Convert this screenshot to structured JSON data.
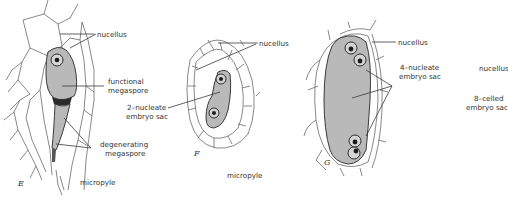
{
  "figure": {
    "panels": [
      {
        "id": "E",
        "letter": "E",
        "labels": {
          "nucellus": "nucellus",
          "functional_megaspore_1": "functional",
          "functional_megaspore_2": "megaspore",
          "degenerating_megaspore_1": "degenerating",
          "degenerating_megaspore_2": "megaspore",
          "micropyle": "micropyle"
        }
      },
      {
        "id": "F",
        "letter": "F",
        "labels": {
          "nucellus": "nucellus",
          "embryo_sac_1": "2–nucleate",
          "embryo_sac_2": "embryo sac",
          "micropyle": "micropyle"
        }
      },
      {
        "id": "G",
        "letter": "G",
        "labels": {
          "nucellus": "nucellus",
          "embryo_sac_1": "4–nucleate",
          "embryo_sac_2": "embryo sac"
        }
      },
      {
        "id": "H",
        "labels": {
          "nucellus": "nucellus",
          "embryo_sac_1": "8–celled",
          "embryo_sac_2": "embryo sac"
        }
      }
    ]
  },
  "colors": {
    "sac_fill": "#b9b9b9",
    "outline": "#3a3a3a",
    "text": "#333333"
  }
}
